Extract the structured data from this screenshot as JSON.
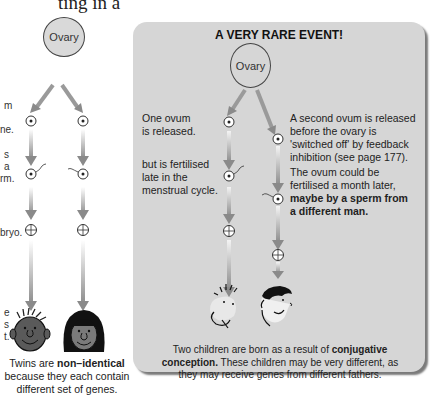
{
  "page": {
    "top_fragment": "ting in a"
  },
  "left_panel": {
    "ovary_label": "Ovary",
    "side_text": [
      {
        "text": "m",
        "y": 106
      },
      {
        "text": "ne.",
        "y": 130
      },
      {
        "text": "s",
        "y": 155
      },
      {
        "text": "a",
        "y": 167
      },
      {
        "text": "rm.",
        "y": 179
      },
      {
        "text": "bryo.",
        "y": 233
      },
      {
        "text": "e",
        "y": 313
      },
      {
        "text": "s",
        "y": 325
      },
      {
        "text": "t.",
        "y": 337
      }
    ],
    "caption_line1_prefix": "Twins are ",
    "caption_line1_bold": "non–identical",
    "caption_line2": "because they each contain",
    "caption_line3": "different set of genes."
  },
  "card": {
    "title": "A VERY RARE EVENT!",
    "ovary_label": "Ovary",
    "left_label_1_line1": "One ovum",
    "left_label_1_line2": "is released.",
    "left_label_2_line1": "but is fertilised",
    "left_label_2_line2": "late in the",
    "left_label_2_line3": "menstrual cycle.",
    "right_label_1_line1": "A second ovum is released",
    "right_label_1_line2": "before the ovary is",
    "right_label_1_line3": "'switched off' by feedback",
    "right_label_1_line4": "inhibition (see page 177).",
    "right_label_2_line1": "The ovum could be",
    "right_label_2_line2": "fertilised a month later,",
    "right_label_2_bold1": "maybe by a sperm from",
    "right_label_2_bold2": "a different man.",
    "bottom_line1_prefix": "Two children are born as a result of ",
    "bottom_line1_bold": "conjugative",
    "bottom_line2_bold": "conception.",
    "bottom_line2_rest": " These children may be very different, as",
    "bottom_line3": "they may receive genes from different fathers."
  },
  "colors": {
    "card_bg": "#d6d6d6",
    "card_shadow": "#7a7a7a",
    "arrow": "#8a8a8a",
    "ovary_fill": "#d9d9d9"
  }
}
